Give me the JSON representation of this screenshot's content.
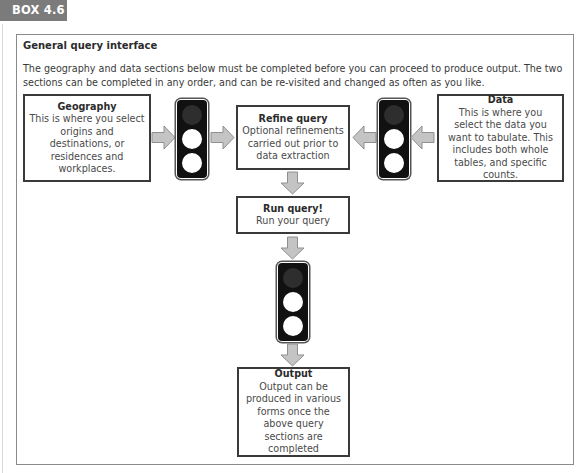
{
  "box_label": "BOX 4.6",
  "panel": {
    "title": "General query interface",
    "intro": "The geography and data sections below must be completed before you can proceed to produce output. The two sections can be completed in any order, and can be re-visited and changed as often as you like."
  },
  "nodes": {
    "geography": {
      "title": "Geography",
      "body": "This is where you select origins and destinations, or residences and workplaces."
    },
    "refine": {
      "title": "Refine query",
      "body": "Optional refinements carried out prior to data extraction"
    },
    "data": {
      "title": "Data",
      "body": "This is where you select the data you want to tabulate. This includes both whole tables, and specific counts."
    },
    "run": {
      "title": "Run query!",
      "body": "Run your query"
    },
    "output": {
      "title": "Output",
      "body": "Output can be produced in various forms once the above query sections are completed"
    }
  },
  "traffic_lights": [
    {
      "id": "geography-light",
      "lamps": [
        "off",
        "on",
        "on"
      ]
    },
    {
      "id": "data-light",
      "lamps": [
        "off",
        "on",
        "on"
      ]
    },
    {
      "id": "run-light",
      "lamps": [
        "off",
        "on",
        "on"
      ]
    }
  ],
  "colors": {
    "tag_bg": "#7b7b7b",
    "arrow_fill": "#c4c4c4",
    "arrow_stroke": "#8f8f8f",
    "light_body": "#111111",
    "lamp_off": "#2e2e2e",
    "lamp_on": "#ffffff"
  }
}
